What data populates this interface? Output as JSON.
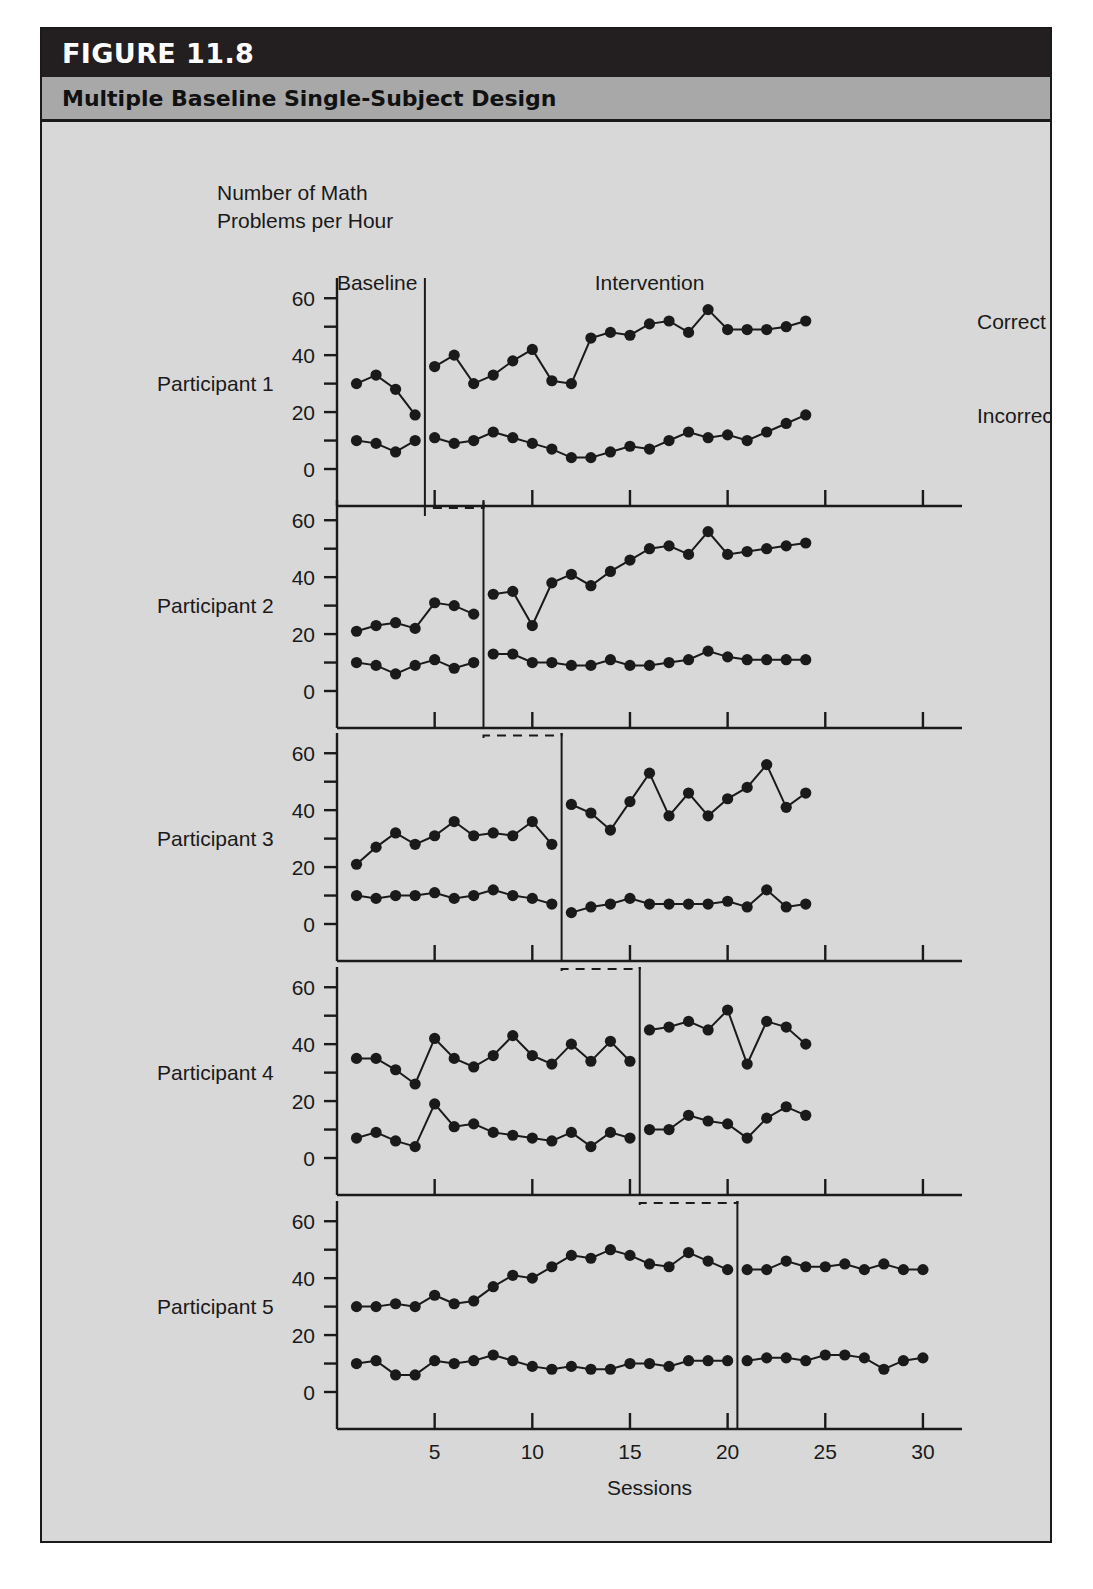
{
  "figure": {
    "number_label": "FIGURE 11.8",
    "title": "Multiple Baseline Single-Subject Design"
  },
  "axes": {
    "y_axis_title_line1": "Number of Math",
    "y_axis_title_line2": "Problems per Hour",
    "x_axis_label": "Sessions",
    "y_ticks_major": [
      0,
      20,
      40,
      60
    ],
    "y_tick_labels": [
      "0",
      "20",
      "40",
      "60"
    ],
    "x_ticks": [
      5,
      10,
      15,
      20,
      25,
      30
    ],
    "x_tick_labels": [
      "5",
      "10",
      "15",
      "20",
      "25",
      "30"
    ],
    "y_min": 0,
    "y_max": 65,
    "x_min": 0,
    "x_max": 32
  },
  "annotations": {
    "phase_baseline": "Baseline",
    "phase_intervention": "Intervention",
    "series_correct": "Correct",
    "series_incorrect": "Incorrect"
  },
  "panel_labels": [
    "Participant 1",
    "Participant 2",
    "Participant 3",
    "Participant 4",
    "Participant 5"
  ],
  "chart_data": {
    "type": "line",
    "title": "Multiple Baseline Single-Subject Design",
    "xlabel": "Sessions",
    "ylabel": "Number of Math Problems per Hour",
    "xlim": [
      0,
      32
    ],
    "ylim": [
      0,
      65
    ],
    "grid": false,
    "legend_position": "right-of-first-panel",
    "legend_entries": [
      "Correct",
      "Incorrect"
    ],
    "marker": "filled-circle",
    "phase_labels": [
      "Baseline",
      "Intervention"
    ],
    "panels": [
      {
        "name": "Participant 1",
        "phase_change_after_session": 4,
        "series": [
          {
            "name": "Correct",
            "baseline": {
              "x": [
                1,
                2,
                3,
                4
              ],
              "y": [
                30,
                33,
                28,
                19
              ]
            },
            "intervention": {
              "x": [
                5,
                6,
                7,
                8,
                9,
                10,
                11,
                12,
                13,
                14,
                15,
                16,
                17,
                18,
                19,
                20,
                21,
                22,
                23,
                24
              ],
              "y": [
                36,
                40,
                30,
                33,
                38,
                42,
                31,
                30,
                46,
                48,
                47,
                51,
                52,
                48,
                56,
                49,
                49,
                49,
                50,
                52
              ]
            }
          },
          {
            "name": "Incorrect",
            "baseline": {
              "x": [
                1,
                2,
                3,
                4
              ],
              "y": [
                10,
                9,
                6,
                10
              ]
            },
            "intervention": {
              "x": [
                5,
                6,
                7,
                8,
                9,
                10,
                11,
                12,
                13,
                14,
                15,
                16,
                17,
                18,
                19,
                20,
                21,
                22,
                23,
                24
              ],
              "y": [
                11,
                9,
                10,
                13,
                11,
                9,
                7,
                4,
                4,
                6,
                8,
                7,
                10,
                13,
                11,
                12,
                10,
                13,
                16,
                19
              ]
            }
          }
        ]
      },
      {
        "name": "Participant 2",
        "phase_change_after_session": 7,
        "series": [
          {
            "name": "Correct",
            "baseline": {
              "x": [
                1,
                2,
                3,
                4,
                5,
                6,
                7
              ],
              "y": [
                21,
                23,
                24,
                22,
                31,
                30,
                27
              ]
            },
            "intervention": {
              "x": [
                8,
                9,
                10,
                11,
                12,
                13,
                14,
                15,
                16,
                17,
                18,
                19,
                20,
                21,
                22,
                23,
                24
              ],
              "y": [
                34,
                35,
                23,
                38,
                41,
                37,
                42,
                46,
                50,
                51,
                48,
                56,
                48,
                49,
                50,
                51,
                52
              ]
            }
          },
          {
            "name": "Incorrect",
            "baseline": {
              "x": [
                1,
                2,
                3,
                4,
                5,
                6,
                7
              ],
              "y": [
                10,
                9,
                6,
                9,
                11,
                8,
                10
              ]
            },
            "intervention": {
              "x": [
                8,
                9,
                10,
                11,
                12,
                13,
                14,
                15,
                16,
                17,
                18,
                19,
                20,
                21,
                22,
                23,
                24
              ],
              "y": [
                13,
                13,
                10,
                10,
                9,
                9,
                11,
                9,
                9,
                10,
                11,
                14,
                12,
                11,
                11,
                11,
                11
              ]
            }
          }
        ]
      },
      {
        "name": "Participant 3",
        "phase_change_after_session": 11,
        "series": [
          {
            "name": "Correct",
            "baseline": {
              "x": [
                1,
                2,
                3,
                4,
                5,
                6,
                7,
                8,
                9,
                10,
                11
              ],
              "y": [
                21,
                27,
                32,
                28,
                31,
                36,
                31,
                32,
                31,
                36,
                28
              ]
            },
            "intervention": {
              "x": [
                12,
                13,
                14,
                15,
                16,
                17,
                18,
                19,
                20,
                21,
                22,
                23,
                24
              ],
              "y": [
                42,
                39,
                33,
                43,
                53,
                38,
                46,
                38,
                44,
                48,
                56,
                41,
                46
              ]
            }
          },
          {
            "name": "Incorrect",
            "baseline": {
              "x": [
                1,
                2,
                3,
                4,
                5,
                6,
                7,
                8,
                9,
                10,
                11
              ],
              "y": [
                10,
                9,
                10,
                10,
                11,
                9,
                10,
                12,
                10,
                9,
                7
              ]
            },
            "intervention": {
              "x": [
                12,
                13,
                14,
                15,
                16,
                17,
                18,
                19,
                20,
                21,
                22,
                23,
                24
              ],
              "y": [
                4,
                6,
                7,
                9,
                7,
                7,
                7,
                7,
                8,
                6,
                12,
                6,
                7
              ]
            }
          }
        ]
      },
      {
        "name": "Participant 4",
        "phase_change_after_session": 15,
        "series": [
          {
            "name": "Correct",
            "baseline": {
              "x": [
                1,
                2,
                3,
                4,
                5,
                6,
                7,
                8,
                9,
                10,
                11,
                12,
                13,
                14,
                15
              ],
              "y": [
                35,
                35,
                31,
                26,
                42,
                35,
                32,
                36,
                43,
                36,
                33,
                40,
                34,
                41,
                34
              ]
            },
            "intervention": {
              "x": [
                16,
                17,
                18,
                19,
                20,
                21,
                22,
                23,
                24
              ],
              "y": [
                45,
                46,
                48,
                45,
                52,
                33,
                48,
                46,
                40
              ]
            }
          },
          {
            "name": "Incorrect",
            "baseline": {
              "x": [
                1,
                2,
                3,
                4,
                5,
                6,
                7,
                8,
                9,
                10,
                11,
                12,
                13,
                14,
                15
              ],
              "y": [
                7,
                9,
                6,
                4,
                19,
                11,
                12,
                9,
                8,
                7,
                6,
                9,
                4,
                9,
                7
              ]
            },
            "intervention": {
              "x": [
                16,
                17,
                18,
                19,
                20,
                21,
                22,
                23,
                24
              ],
              "y": [
                10,
                10,
                15,
                13,
                12,
                7,
                14,
                18,
                15
              ]
            }
          }
        ]
      },
      {
        "name": "Participant 5",
        "phase_change_after_session": 20,
        "series": [
          {
            "name": "Correct",
            "baseline": {
              "x": [
                1,
                2,
                3,
                4,
                5,
                6,
                7,
                8,
                9,
                10,
                11,
                12,
                13,
                14,
                15,
                16,
                17,
                18,
                19,
                20
              ],
              "y": [
                30,
                30,
                31,
                30,
                34,
                31,
                32,
                37,
                41,
                40,
                44,
                48,
                47,
                50,
                48,
                45,
                44,
                49,
                46,
                43
              ]
            },
            "intervention": {
              "x": [
                21,
                22,
                23,
                24,
                25,
                26,
                27,
                28,
                29,
                30
              ],
              "y": [
                43,
                43,
                46,
                44,
                44,
                45,
                43,
                45,
                43,
                43
              ]
            }
          },
          {
            "name": "Incorrect",
            "baseline": {
              "x": [
                1,
                2,
                3,
                4,
                5,
                6,
                7,
                8,
                9,
                10,
                11,
                12,
                13,
                14,
                15,
                16,
                17,
                18,
                19,
                20
              ],
              "y": [
                10,
                11,
                6,
                6,
                11,
                10,
                11,
                13,
                11,
                9,
                8,
                9,
                8,
                8,
                10,
                10,
                9,
                11,
                11,
                11
              ]
            },
            "intervention": {
              "x": [
                21,
                22,
                23,
                24,
                25,
                26,
                27,
                28,
                29,
                30
              ],
              "y": [
                11,
                12,
                12,
                11,
                13,
                13,
                12,
                8,
                11,
                12
              ]
            }
          }
        ]
      }
    ]
  }
}
